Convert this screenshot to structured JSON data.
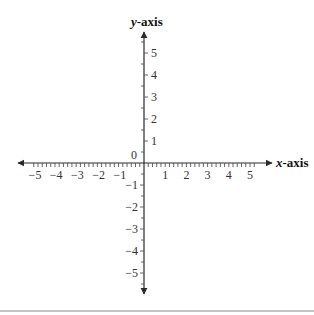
{
  "chart_data": {
    "type": "coordinate-plane",
    "title": "",
    "xlabel": "x-axis",
    "ylabel": "y-axis",
    "x_ticks": [
      -5,
      -4,
      -3,
      -2,
      -1,
      1,
      2,
      3,
      4,
      5
    ],
    "y_ticks": [
      5,
      4,
      3,
      2,
      1,
      -1,
      -2,
      -3,
      -4,
      -5
    ],
    "x_tick_labels": [
      "−5",
      "−4",
      "−3",
      "−2",
      "−1",
      "1",
      "2",
      "3",
      "4",
      "5"
    ],
    "y_tick_labels_positive": [
      "5",
      "4",
      "3",
      "2",
      "1"
    ],
    "y_tick_labels_negative": [
      "−1",
      "−2",
      "−3",
      "−4",
      "−5"
    ],
    "origin_label": "0",
    "xlim": [
      -5.5,
      6
    ],
    "ylim": [
      -6,
      6
    ],
    "x_minor_step": 0.2,
    "y_minor_step": 0.5,
    "grid": false,
    "arrows": "both axes, both directions"
  },
  "labels": {
    "x_axis_var": "x",
    "x_axis_suffix": "-axis",
    "y_axis_var": "y",
    "y_axis_suffix": "-axis",
    "origin": "0"
  },
  "colors": {
    "axis": "#2a2a2a",
    "ticks": "#555555",
    "text": "#333333",
    "bottom_rule": "#8a8a8a"
  }
}
